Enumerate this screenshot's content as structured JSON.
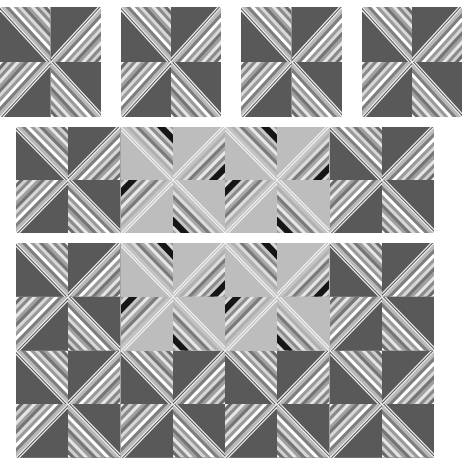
{
  "colors": {
    "dark_solid": "#595959",
    "light_solid": "#bdbdbd",
    "white_line": "#f4f4f4",
    "black_line": "#111111",
    "seam": "#2a2a2a"
  },
  "stripes": {
    "dark": [
      "#f2f2f2",
      "#6a6a6a",
      "#cfcfcf",
      "#8a8a8a",
      "#e6e6e6",
      "#a0a0a0",
      "#757575",
      "#d8d8d8",
      "#9a9a9a",
      "#ffffff",
      "#7e7e7e",
      "#b9b9b9"
    ],
    "light": [
      "#9c9c9c",
      "#d9d9d9",
      "#161616",
      "#161616",
      "#c8c8c8",
      "#8c8c8c",
      "#e8e8e8",
      "#a8a8a8",
      "#7a7a7a",
      "#dcdcdc",
      "#b0b0b0",
      "#c4c4c4"
    ]
  },
  "panels": [
    {
      "name": "block-1",
      "x": 0,
      "y": 7,
      "w": 101,
      "h": 110,
      "cols": 2,
      "rows": 2,
      "light": []
    },
    {
      "name": "block-2",
      "x": 121,
      "y": 7,
      "w": 100,
      "h": 110,
      "cols": 2,
      "rows": 2,
      "light": []
    },
    {
      "name": "block-3",
      "x": 241,
      "y": 7,
      "w": 101,
      "h": 110,
      "cols": 2,
      "rows": 2,
      "light": []
    },
    {
      "name": "block-4",
      "x": 362,
      "y": 7,
      "w": 100,
      "h": 110,
      "cols": 2,
      "rows": 2,
      "light": []
    },
    {
      "name": "border-strip",
      "x": 16,
      "y": 127,
      "w": 418,
      "h": 106,
      "cols": 8,
      "rows": 2,
      "light": [
        [
          0,
          2
        ],
        [
          0,
          3
        ],
        [
          0,
          4
        ],
        [
          0,
          5
        ],
        [
          1,
          2
        ],
        [
          1,
          3
        ],
        [
          1,
          4
        ],
        [
          1,
          5
        ]
      ]
    },
    {
      "name": "quilt-layout",
      "x": 16,
      "y": 243,
      "w": 418,
      "h": 215,
      "cols": 8,
      "rows": 4,
      "light": [
        [
          0,
          2
        ],
        [
          0,
          3
        ],
        [
          0,
          4
        ],
        [
          0,
          5
        ],
        [
          1,
          2
        ],
        [
          1,
          3
        ],
        [
          1,
          4
        ],
        [
          1,
          5
        ]
      ]
    }
  ]
}
